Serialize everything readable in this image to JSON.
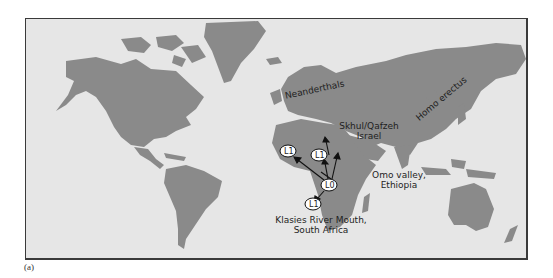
{
  "figure": {
    "caption_label": "(a)",
    "colors": {
      "ocean": "#e6e6e6",
      "land": "#8a8a8a",
      "border": "#3a3a3a",
      "text": "#1e1e1e"
    }
  },
  "map": {
    "labels": {
      "neanderthals": "Neanderthals",
      "homo_erectus": "Homo erectus",
      "skhul_line1": "Skhul/Qafzeh",
      "skhul_line2": "Israel",
      "omo_line1": "Omo valley,",
      "omo_line2": "Ethiopia",
      "klasies_line1": "Klasies River Mouth,",
      "klasies_line2": "South Africa"
    },
    "haplogroup_markers": [
      {
        "label": "L1",
        "location": "west Africa"
      },
      {
        "label": "L1",
        "location": "north-east Africa"
      },
      {
        "label": "L0",
        "location": "east Africa"
      },
      {
        "label": "L1",
        "location": "southern Africa"
      }
    ]
  }
}
